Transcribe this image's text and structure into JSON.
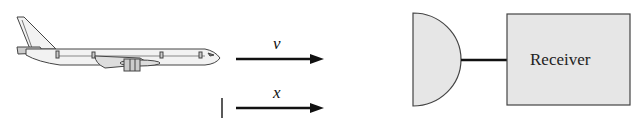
{
  "diagram": {
    "aircraft": {
      "name": "airplane"
    },
    "velocity_arrow": {
      "label": "v"
    },
    "position_arrow": {
      "label": "x"
    },
    "antenna": {
      "name": "antenna"
    },
    "receiver": {
      "label": "Receiver"
    },
    "colors": {
      "fill": "#e6e6e6",
      "stroke": "#333333",
      "arrow": "#111111"
    }
  }
}
